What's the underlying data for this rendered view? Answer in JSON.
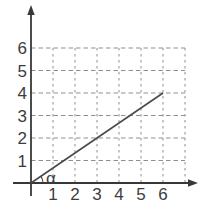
{
  "figure": {
    "background": "#ffffff",
    "axis_color": "#383838",
    "line_color": "#4a4a4a",
    "grid_color": "#8f8f8f",
    "text_color": "#3c3c3c"
  },
  "chart_data": {
    "type": "line",
    "title": "",
    "xlabel": "",
    "ylabel": "",
    "x_ticks": [
      1,
      2,
      3,
      4,
      5,
      6
    ],
    "y_ticks": [
      1,
      2,
      3,
      4,
      5,
      6
    ],
    "xlim": [
      0,
      7.7
    ],
    "ylim": [
      0,
      7.7
    ],
    "grid": "dashed",
    "grid_cols": 7,
    "grid_rows": 6,
    "legend": "none",
    "series": [
      {
        "name": "ray-through-origin",
        "x": [
          0,
          6
        ],
        "y": [
          0,
          4
        ]
      }
    ],
    "annotations": [
      {
        "type": "angle-arc",
        "label": "α",
        "vertex_x": 0,
        "vertex_y": 0,
        "between": "x-axis and line"
      }
    ]
  }
}
